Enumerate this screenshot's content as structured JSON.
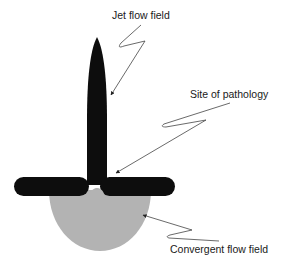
{
  "diagram": {
    "labels": {
      "jet_flow_field": "Jet flow field",
      "site_of_pathology": "Site of pathology",
      "convergent_flow_field": "Convergent flow field"
    },
    "colors": {
      "jet": "#0d0d0d",
      "barrier": "#0d0d0d",
      "convergent_region": "#b3b3b3",
      "leader_lines": "#444444",
      "background": "#ffffff"
    },
    "elements": [
      {
        "name": "jet-flow-field",
        "shape": "elongated spindle",
        "fill": "black"
      },
      {
        "name": "valve-barrier",
        "shape": "horizontal rounded bar with central gap",
        "fill": "black"
      },
      {
        "name": "convergent-flow-field",
        "shape": "hemispherical bowl",
        "fill": "gray"
      }
    ]
  }
}
